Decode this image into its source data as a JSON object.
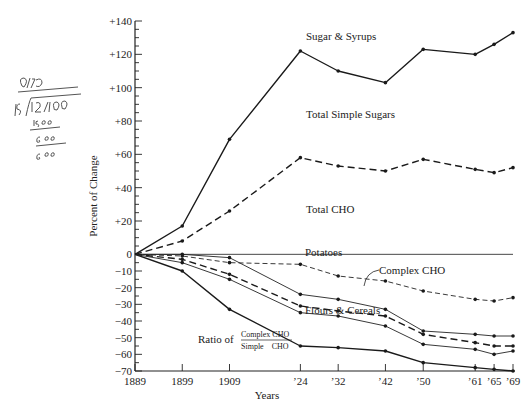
{
  "chart_data": {
    "type": "line",
    "title": "",
    "xlabel": "Years",
    "ylabel": "Percent of Change",
    "ylim": [
      -70,
      140
    ],
    "y_ticks": [
      140,
      120,
      100,
      80,
      60,
      40,
      20,
      0,
      -10,
      -20,
      -30,
      -40,
      -50,
      -60,
      -70
    ],
    "y_tick_labels": [
      "+140",
      "+120",
      "+100",
      "+80",
      "+60",
      "+40",
      "+20",
      "0",
      "−10",
      "−20",
      "−30",
      "−40",
      "−50",
      "−60",
      "−70"
    ],
    "x": [
      1889,
      1899,
      1909,
      1924,
      1932,
      1942,
      1950,
      1961,
      1965,
      1969
    ],
    "x_tick_labels": [
      "1889",
      "1899",
      "1909",
      "’24",
      "’32",
      "’42",
      "’50",
      "’61",
      "’65",
      "’69"
    ],
    "grid": false,
    "zero_line": true,
    "series": [
      {
        "name": "Sugar & Syrups",
        "style": "solid",
        "values": [
          0,
          17,
          69,
          122,
          110,
          103,
          123,
          120,
          126,
          133
        ]
      },
      {
        "name": "Total Simple Sugars",
        "style": "dashed",
        "values": [
          0,
          8,
          26,
          58,
          53,
          50,
          57,
          51,
          49,
          52
        ]
      },
      {
        "name": "Total CHO",
        "style": "dashed-light",
        "values": [
          0,
          -1,
          -5,
          -6,
          -13,
          -16,
          -22,
          -27,
          -28,
          -26
        ]
      },
      {
        "name": "Potatoes",
        "style": "solid-light",
        "values": [
          0,
          0,
          -2,
          -24,
          -27,
          -33,
          -46,
          -48,
          -49,
          -49
        ]
      },
      {
        "name": "Complex CHO",
        "style": "dashed",
        "values": [
          0,
          -3,
          -12,
          -31,
          -34,
          -37,
          -48,
          -53,
          -55,
          -55
        ]
      },
      {
        "name": "Flours & Cereals",
        "style": "solid-light",
        "values": [
          0,
          -5,
          -15,
          -35,
          -37,
          -43,
          -54,
          -57,
          -60,
          -58
        ]
      },
      {
        "name": "Ratio of Complex CHO / Simple CHO",
        "style": "solid",
        "values": [
          0,
          -10,
          -33,
          -55,
          -56,
          -58,
          -65,
          -68,
          -69,
          -70
        ]
      }
    ],
    "annotations": [
      {
        "text": "Sugar & Syrups",
        "series": "Sugar & Syrups"
      },
      {
        "text": "Total Simple Sugars",
        "series": "Total Simple Sugars"
      },
      {
        "text": "Total CHO",
        "series": "Total CHO"
      },
      {
        "text": "Potatoes",
        "series": "Potatoes"
      },
      {
        "text": "Complex CHO",
        "series": "Complex CHO"
      },
      {
        "text": "Flours & Cereals",
        "series": "Flours & Cereals"
      },
      {
        "text": "Ratio of",
        "series": "Ratio of Complex CHO / Simple CHO",
        "fraction_numerator": "Complex CHO",
        "fraction_denominator": "Simple    CHO"
      }
    ]
  },
  "handwritten_note": {
    "lines": [
      "0 1⁄4⁄0",
      "15 | 12⁄00",
      "1500",
      "600",
      "600"
    ]
  }
}
